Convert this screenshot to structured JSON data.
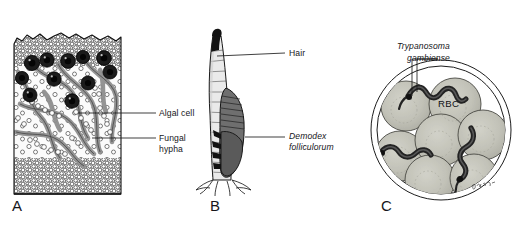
{
  "figure": {
    "background_color": "#ffffff",
    "ink_color": "#16161a",
    "panels": [
      {
        "letter": "A",
        "name": "lichen-thallus-cross-section",
        "labels": [
          {
            "id": "algal-cell",
            "text": "Algal cell"
          },
          {
            "id": "fungal-hypha-line1",
            "text": "Fungal"
          },
          {
            "id": "fungal-hypha-line2",
            "text": "hypha"
          }
        ],
        "colors": {
          "cortex": "#e8e8e8",
          "algal_cell": "#1d1d1d",
          "hypha": "#b4b4b4",
          "medulla": "#f2f2f2"
        }
      },
      {
        "letter": "B",
        "name": "hair-follicle-with-demodex-mite",
        "labels": [
          {
            "id": "hair",
            "text": "Hair"
          },
          {
            "id": "demodex-line1",
            "text": "Demodex",
            "italic": true
          },
          {
            "id": "demodex-line2",
            "text": "folliculorum",
            "italic": true
          }
        ],
        "colors": {
          "hair_shaft": "#e4e4e4",
          "hair_tip": "#1a1a1a",
          "mite_body": "#6e6e6e"
        }
      },
      {
        "letter": "C",
        "name": "blood-smear-with-trypanosomes",
        "labels": [
          {
            "id": "trypanosoma-line1",
            "text": "Trypanosoma",
            "italic": true
          },
          {
            "id": "trypanosoma-line2",
            "text": "gambiense",
            "italic": true
          },
          {
            "id": "rbc",
            "text": "RBC",
            "italic": false
          }
        ],
        "red_blood_cell_count": 7,
        "trypanosome_count": 3,
        "colors": {
          "rbc_fill": "#bdbdb4",
          "trypanosome": "#2b2b2b",
          "field_ring": "#2a2a2a"
        }
      }
    ]
  }
}
